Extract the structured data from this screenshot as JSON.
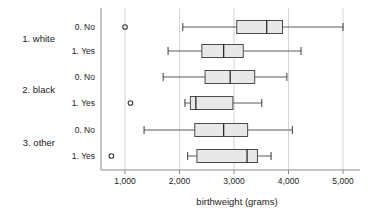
{
  "chart_data": {
    "type": "box",
    "orientation": "horizontal",
    "title": "",
    "xlabel": "birthweight (grams)",
    "ylabel": "",
    "xlim": [
      600,
      5200
    ],
    "xticks": [
      1000,
      2000,
      3000,
      4000,
      5000
    ],
    "xticklabels": [
      "1,000",
      "2,000",
      "3,000",
      "4,000",
      "5,000"
    ],
    "grid": "vertical",
    "legend": "none",
    "group_labels": [
      "1. white",
      "2. black",
      "3. other"
    ],
    "sub_labels": [
      "0. No",
      "1. Yes"
    ],
    "boxes": [
      {
        "group": "1. white",
        "sub": "0. No",
        "whisker_low": 2060,
        "q1": 3050,
        "median": 3600,
        "q3": 3890,
        "whisker_high": 5000,
        "outliers": [
          1000
        ]
      },
      {
        "group": "1. white",
        "sub": "1. Yes",
        "whisker_low": 1790,
        "q1": 2410,
        "median": 2810,
        "q3": 3170,
        "whisker_high": 4230,
        "outliers": []
      },
      {
        "group": "2. black",
        "sub": "0. No",
        "whisker_low": 1700,
        "q1": 2470,
        "median": 2930,
        "q3": 3380,
        "whisker_high": 3970,
        "outliers": []
      },
      {
        "group": "2. black",
        "sub": "1. Yes",
        "whisker_low": 2100,
        "q1": 2200,
        "median": 2300,
        "q3": 2980,
        "whisker_high": 3510,
        "outliers": [
          1100
        ]
      },
      {
        "group": "3. other",
        "sub": "0. No",
        "whisker_low": 1350,
        "q1": 2280,
        "median": 2810,
        "q3": 3250,
        "whisker_high": 4070,
        "outliers": []
      },
      {
        "group": "3. other",
        "sub": "1. Yes",
        "whisker_low": 2150,
        "q1": 2320,
        "median": 3240,
        "q3": 3430,
        "whisker_high": 3680,
        "outliers": [
          750
        ]
      }
    ],
    "colors": {
      "box_fill": "#e8e8e8",
      "box_edge": "#4a4a4a",
      "median": "#2a2a2a",
      "whisker": "#5a5a5a",
      "grid": "#c9c9c9",
      "axis": "#8a8a8a",
      "text": "#222222"
    }
  }
}
